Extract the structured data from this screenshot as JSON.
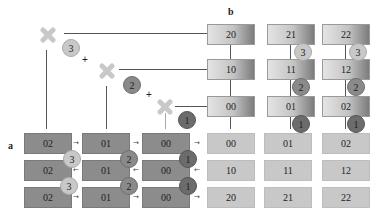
{
  "labels": {
    "a": "a",
    "b": "b"
  },
  "icons": {
    "multiply": "multiply-x-icon",
    "plus": "+"
  },
  "colors": {
    "dark_box": "#8c8c8c",
    "light_box": "#c8c8c8",
    "circle_3": "#c8c8c8",
    "circle_2": "#8a8a8a",
    "circle_1": "#6c6c6c",
    "x_mark": "#c8c8c8"
  },
  "steps": [
    "3",
    "2",
    "1"
  ],
  "panel_a": {
    "rows": [
      [
        "02",
        "01",
        "00"
      ],
      [
        "02",
        "01",
        "00"
      ],
      [
        "02",
        "01",
        "00"
      ]
    ]
  },
  "panel_b_top": {
    "rows": [
      [
        "20",
        "21",
        "22"
      ],
      [
        "10",
        "11",
        "12"
      ],
      [
        "00",
        "01",
        "02"
      ]
    ]
  },
  "panel_b_grid": {
    "rows": [
      [
        "00",
        "01",
        "02"
      ],
      [
        "10",
        "11",
        "12"
      ],
      [
        "20",
        "21",
        "22"
      ]
    ]
  },
  "plus_signs": [
    "+",
    "+"
  ]
}
